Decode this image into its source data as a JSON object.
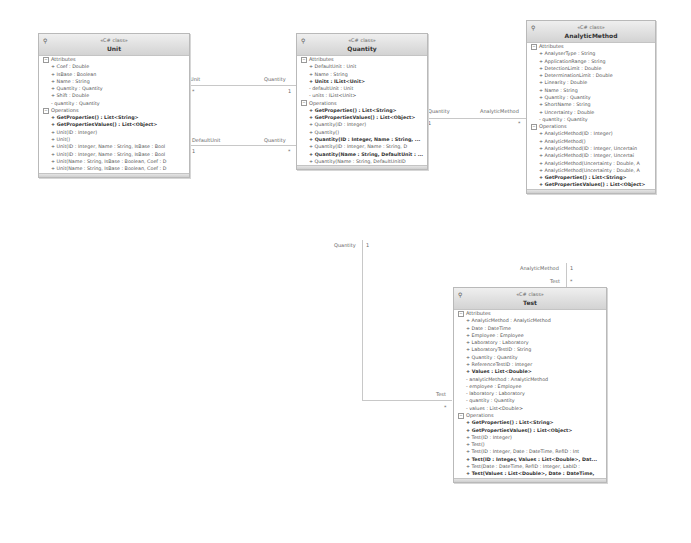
{
  "classes": {
    "unit": {
      "stereotype": "«C# class»",
      "name": "Unit",
      "attributes_label": "Attributes",
      "attributes": [
        "+ Coef : Double",
        "+ IsBase : Boolean",
        "+ Name : String",
        "+ Quantity : Quantity",
        "+ Shift : Double",
        "- quantity : Quantity"
      ],
      "operations_label": "Operations",
      "operations": [
        "+ GetProperties() : List<String>",
        "+ GetPropertiesValues() : List<Object>",
        "+ Unit(ID : Integer)",
        "+ Unit()",
        "+ Unit(ID : Integer, Name : String, IsBase : Bool",
        "+ Unit(ID : Integer, Name : String, IsBase : Bool",
        "+ Unit(Name : String, IsBase : Boolean, Coef : D",
        "+ Unit(Name : String, IsBase : Boolean, Coef : D"
      ]
    },
    "quantity": {
      "stereotype": "«C# class»",
      "name": "Quantity",
      "attributes_label": "Attributes",
      "attributes": [
        "+ DefaultUnit : Unit",
        "+ Name : String",
        "+ Units : IList<Unit>",
        "- defaultUnit : Unit",
        "- units : IList<Unit>"
      ],
      "operations_label": "Operations",
      "operations": [
        "+ GetProperties() : List<String>",
        "+ GetPropertiesValues() : List<Object>",
        "+ Quantity(ID : Integer)",
        "+ Quantity()",
        "+ Quantity(ID : Integer, Name : String, ...",
        "+ Quantity(ID : Integer, Name : String, D",
        "+ Quantity(Name : String, DefaultUnit : ...",
        "+ Quantity(Name : String, DefaultUnitID"
      ]
    },
    "analytic_method": {
      "stereotype": "«C# class»",
      "name": "AnalyticMethod",
      "attributes_label": "Attributes",
      "attributes": [
        "+ AnalyserType : String",
        "+ ApplicationRange : String",
        "+ DetectionLimit : Double",
        "+ DeterminationLimit : Double",
        "+ Linearity : Double",
        "+ Name : String",
        "+ Quantity : Quantity",
        "+ ShortName : String",
        "+ Uncertainty : Double",
        "- quantity : Quantity"
      ],
      "operations_label": "Operations",
      "operations": [
        "+ AnalyticMethod(ID : Integer)",
        "+ AnalyticMethod()",
        "+ AnalyticMethod(ID : Integer, Uncertain",
        "+ AnalyticMethod(ID : Integer, Uncertai",
        "+ AnalyticMethod(Uncertainty : Double, A",
        "+ AnalyticMethod(Uncertainty : Double, A",
        "+ GetProperties() : List<String>",
        "+ GetPropertiesValues() : List<Object>"
      ]
    },
    "test": {
      "stereotype": "«C# class»",
      "name": "Test",
      "attributes_label": "Attributes",
      "attributes": [
        "+ AnalyticMethod : AnalyticMethod",
        "+ Date : DateTime",
        "+ Employee : Employee",
        "+ Laboratory : Laboratory",
        "+ LaboratoryTestID : String",
        "+ Quantity : Quantity",
        "+ ReferenceTestID : Integer",
        "+ Values : List<Double>",
        "- analyticMethod : AnalyticMethod",
        "- employee : Employee",
        "- laboratory : Laboratory",
        "- quantity : Quantity",
        "- values : List<Double>"
      ],
      "operations_label": "Operations",
      "operations": [
        "+ GetProperties() : List<String>",
        "+ GetPropertiesValues() : List<Object>",
        "+ Test(ID : Integer)",
        "+ Test()",
        "+ Test(ID : Integer, Date : DateTime, RefID : Int",
        "+ Test(ID : Integer, Values : List<Double>, Dat...",
        "+ Test(Date : DateTime, RefID : Integer, LabID :",
        "+ Test(Values : List<Double>, Date : DateTime,"
      ]
    }
  },
  "associations": [
    {
      "from": "Unit",
      "to": "Quantity",
      "from_role": "Unit",
      "from_mult": "*",
      "to_role": "Quantity",
      "to_mult": "1"
    },
    {
      "from": "Unit",
      "to": "Quantity",
      "from_role": "DefaultUnit",
      "from_mult": "1",
      "to_role": "Quantity",
      "to_mult": "*"
    },
    {
      "from": "Quantity",
      "to": "AnalyticMethod",
      "from_role": "Quantity",
      "from_mult": "1",
      "to_role": "AnalyticMethod",
      "to_mult": "*"
    },
    {
      "from": "AnalyticMethod",
      "to": "Test",
      "from_role": "AnalyticMethod",
      "from_mult": "1",
      "to_role": "Test",
      "to_mult": "*"
    },
    {
      "from": "Quantity",
      "to": "Test",
      "from_role": "Quantity",
      "from_mult": "1",
      "to_role": "Test",
      "to_mult": "*"
    }
  ],
  "icons": {
    "pin": "⚲",
    "collapse": "−"
  }
}
